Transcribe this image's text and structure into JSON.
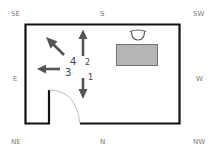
{
  "compass": {
    "se": "SE",
    "s": "S",
    "sw": "SW",
    "e": "E",
    "w": "W",
    "ne": "NE",
    "n": "N",
    "nw": "NW"
  },
  "arrows": [
    {
      "label": "1",
      "direction": "down"
    },
    {
      "label": "2",
      "direction": "up"
    },
    {
      "label": "3",
      "direction": "left"
    },
    {
      "label": "4",
      "direction": "up-left"
    }
  ],
  "furniture": {
    "desk": "desk",
    "chair": "chair"
  },
  "colors": {
    "wall": "#111111",
    "arrow": "#555555",
    "desk_fill": "#b5b5b5",
    "desk_stroke": "#666666",
    "door_arc": "#aaaaaa",
    "compass_text": "#7a7a7a"
  }
}
